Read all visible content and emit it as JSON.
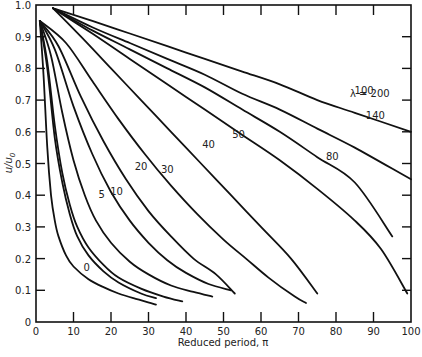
{
  "chart_data": {
    "type": "line",
    "title": "",
    "xlabel": "Reduced period, π",
    "ylabel": "u/u₀",
    "xlim": [
      0,
      100
    ],
    "ylim": [
      0,
      1.0
    ],
    "grid": false,
    "legend": "inline curve labels",
    "x_ticks": [
      0,
      10,
      20,
      30,
      40,
      50,
      60,
      70,
      80,
      90,
      100
    ],
    "x_tick_labels": [
      "0",
      "10",
      "20",
      "30",
      "40",
      "50",
      "60",
      "70",
      "80",
      "90",
      "100"
    ],
    "y_ticks": [
      0,
      0.1,
      0.2,
      0.3,
      0.4,
      0.5,
      0.6,
      0.7,
      0.8,
      0.9,
      1.0
    ],
    "y_tick_labels": [
      "0",
      "0.1",
      "0.2",
      "0.3",
      "0.4",
      "0.5",
      "0.6",
      "0.7",
      "0.8",
      "0.9",
      "1.0"
    ],
    "series": [
      {
        "name": "0",
        "label": "0",
        "label_pos": [
          13.5,
          0.16
        ],
        "x": [
          1,
          2,
          3,
          4,
          5,
          6,
          8,
          10,
          14,
          18,
          22,
          26,
          32
        ],
        "y": [
          0.95,
          0.78,
          0.55,
          0.4,
          0.32,
          0.27,
          0.21,
          0.175,
          0.135,
          0.11,
          0.09,
          0.075,
          0.055
        ]
      },
      {
        "name": "5",
        "label": "5",
        "label_pos": [
          17.5,
          0.39
        ],
        "x": [
          1,
          3,
          5,
          7,
          9,
          11,
          14,
          18,
          22,
          28,
          34,
          39
        ],
        "y": [
          0.95,
          0.82,
          0.62,
          0.47,
          0.37,
          0.3,
          0.235,
          0.18,
          0.14,
          0.105,
          0.08,
          0.065
        ]
      },
      {
        "name": "2",
        "label": "",
        "label_pos": null,
        "x": [
          1,
          3,
          5,
          7,
          9,
          11,
          14,
          18,
          22,
          28,
          32
        ],
        "y": [
          0.95,
          0.8,
          0.58,
          0.44,
          0.34,
          0.27,
          0.21,
          0.16,
          0.125,
          0.09,
          0.075
        ]
      },
      {
        "name": "10",
        "label": "10",
        "label_pos": [
          21.5,
          0.4
        ],
        "x": [
          1,
          4,
          7,
          10,
          13,
          16,
          20,
          25,
          30,
          36,
          42,
          47
        ],
        "y": [
          0.95,
          0.84,
          0.66,
          0.51,
          0.4,
          0.32,
          0.25,
          0.19,
          0.15,
          0.115,
          0.095,
          0.08
        ]
      },
      {
        "name": "20",
        "label": "20",
        "label_pos": [
          28.0,
          0.48
        ],
        "x": [
          1,
          5,
          10,
          15,
          20,
          25,
          30,
          35,
          40,
          46,
          52
        ],
        "y": [
          0.95,
          0.86,
          0.68,
          0.53,
          0.41,
          0.32,
          0.25,
          0.195,
          0.155,
          0.12,
          0.1
        ]
      },
      {
        "name": "30",
        "label": "30",
        "label_pos": [
          35.0,
          0.47
        ],
        "x": [
          1,
          6,
          12,
          18,
          24,
          30,
          36,
          42,
          48,
          53
        ],
        "y": [
          0.95,
          0.87,
          0.71,
          0.57,
          0.45,
          0.35,
          0.27,
          0.2,
          0.15,
          0.09
        ]
      },
      {
        "name": "40",
        "label": "40",
        "label_pos": [
          46.0,
          0.55
        ],
        "x": [
          1,
          8,
          15,
          22,
          29,
          36,
          43,
          50,
          56,
          62,
          69,
          72
        ],
        "y": [
          0.95,
          0.88,
          0.76,
          0.64,
          0.53,
          0.43,
          0.34,
          0.26,
          0.2,
          0.14,
          0.08,
          0.06
        ]
      },
      {
        "name": "50",
        "label": "50",
        "label_pos": [
          54.0,
          0.58
        ],
        "x": [
          4.5,
          12,
          20,
          28,
          36,
          44,
          52,
          60,
          68,
          75
        ],
        "y": [
          0.99,
          0.9,
          0.8,
          0.7,
          0.6,
          0.5,
          0.4,
          0.3,
          0.2,
          0.09
        ]
      },
      {
        "name": "80",
        "label": "80",
        "label_pos": [
          79.0,
          0.51
        ],
        "x": [
          4.5,
          15,
          25,
          35,
          45,
          55,
          65,
          75,
          85,
          92,
          99
        ],
        "y": [
          0.99,
          0.91,
          0.83,
          0.75,
          0.67,
          0.59,
          0.51,
          0.42,
          0.32,
          0.23,
          0.09
        ]
      },
      {
        "name": "100",
        "label": "100",
        "label_pos": [
          87.5,
          0.72
        ],
        "x": [
          4.5,
          15,
          25,
          35,
          45,
          55,
          65,
          75,
          85,
          95
        ],
        "y": [
          0.99,
          0.92,
          0.86,
          0.8,
          0.74,
          0.67,
          0.6,
          0.52,
          0.44,
          0.27
        ]
      },
      {
        "name": "140",
        "label": "140",
        "label_pos": [
          90.5,
          0.64
        ],
        "x": [
          4.5,
          15,
          25,
          35,
          45,
          55,
          65,
          75,
          85,
          100
        ],
        "y": [
          0.99,
          0.93,
          0.88,
          0.83,
          0.78,
          0.72,
          0.67,
          0.61,
          0.55,
          0.45
        ]
      },
      {
        "name": "200",
        "label": "λ = 200",
        "label_pos": [
          89.0,
          0.71
        ],
        "x": [
          4.5,
          15,
          25,
          35,
          45,
          55,
          65,
          75,
          85,
          100
        ],
        "y": [
          0.99,
          0.95,
          0.91,
          0.87,
          0.83,
          0.79,
          0.75,
          0.7,
          0.66,
          0.6
        ]
      }
    ]
  },
  "axes": {
    "xlabel": "Reduced period, π",
    "ylabel_main": "u/u",
    "ylabel_sub": "0"
  }
}
